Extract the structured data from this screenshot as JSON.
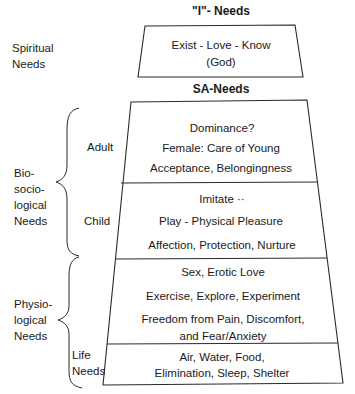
{
  "headings": {
    "top": "\"I\"- Needs",
    "middle": "SA-Needs"
  },
  "left_labels": {
    "spiritual": [
      "Spiritual",
      "Needs"
    ],
    "biosociological": [
      "Bio-",
      "socio-",
      "logical",
      "Needs"
    ],
    "physiological": [
      "Physio-",
      "logical",
      "Needs"
    ],
    "adult": "Adult",
    "child": "Child",
    "life": [
      "Life",
      "Needs"
    ]
  },
  "levels": {
    "spiritual": [
      "Exist - Love - Know",
      "(God)"
    ],
    "adult": [
      "Dominance?",
      "Female: Care of Young",
      "Acceptance, Belongingness"
    ],
    "child": [
      "Imitate ··",
      "Play - Physical Pleasure",
      "Affection, Protection, Nurture"
    ],
    "physiological": [
      "Sex, Erotic Love",
      "Exercise, Explore, Experiment",
      "Freedom from Pain, Discomfort,",
      "and Fear/Anxiety"
    ],
    "life": [
      "Air, Water, Food,",
      "Elimination, Sleep, Shelter"
    ]
  },
  "colors": {
    "line": "#2a2a2a",
    "text": "#1a1a1a",
    "background": "#ffffff"
  }
}
